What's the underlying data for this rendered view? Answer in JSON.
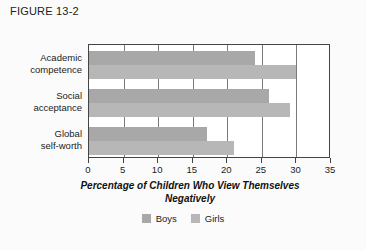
{
  "figure": {
    "title": "FIGURE 13-2"
  },
  "chart_data": {
    "type": "bar",
    "orientation": "horizontal",
    "title": "",
    "xlabel": "Percentage of Children Who View Themselves Negatively",
    "xlabel_line1": "Percentage of Children Who View Themselves",
    "xlabel_line2": "Negatively",
    "ylabel": "",
    "categories": [
      "Academic competence",
      "Social acceptance",
      "Global self-worth"
    ],
    "category_lines": [
      [
        "Academic",
        "competence"
      ],
      [
        "Social",
        "acceptance"
      ],
      [
        "Global",
        "self-worth"
      ]
    ],
    "series": [
      {
        "name": "Boys",
        "color": "#a8a8a8",
        "values": [
          24,
          26,
          17
        ]
      },
      {
        "name": "Girls",
        "color": "#b7b7b7",
        "values": [
          30,
          29,
          21
        ]
      }
    ],
    "xlim": [
      0,
      35
    ],
    "xticks": [
      0,
      5,
      10,
      15,
      20,
      25,
      30,
      35
    ],
    "xtick_labels": [
      "0",
      "5",
      "10",
      "15",
      "20",
      "25",
      "30",
      "35"
    ],
    "grid": true,
    "grid_axis": "x",
    "legend_position": "bottom-center"
  }
}
